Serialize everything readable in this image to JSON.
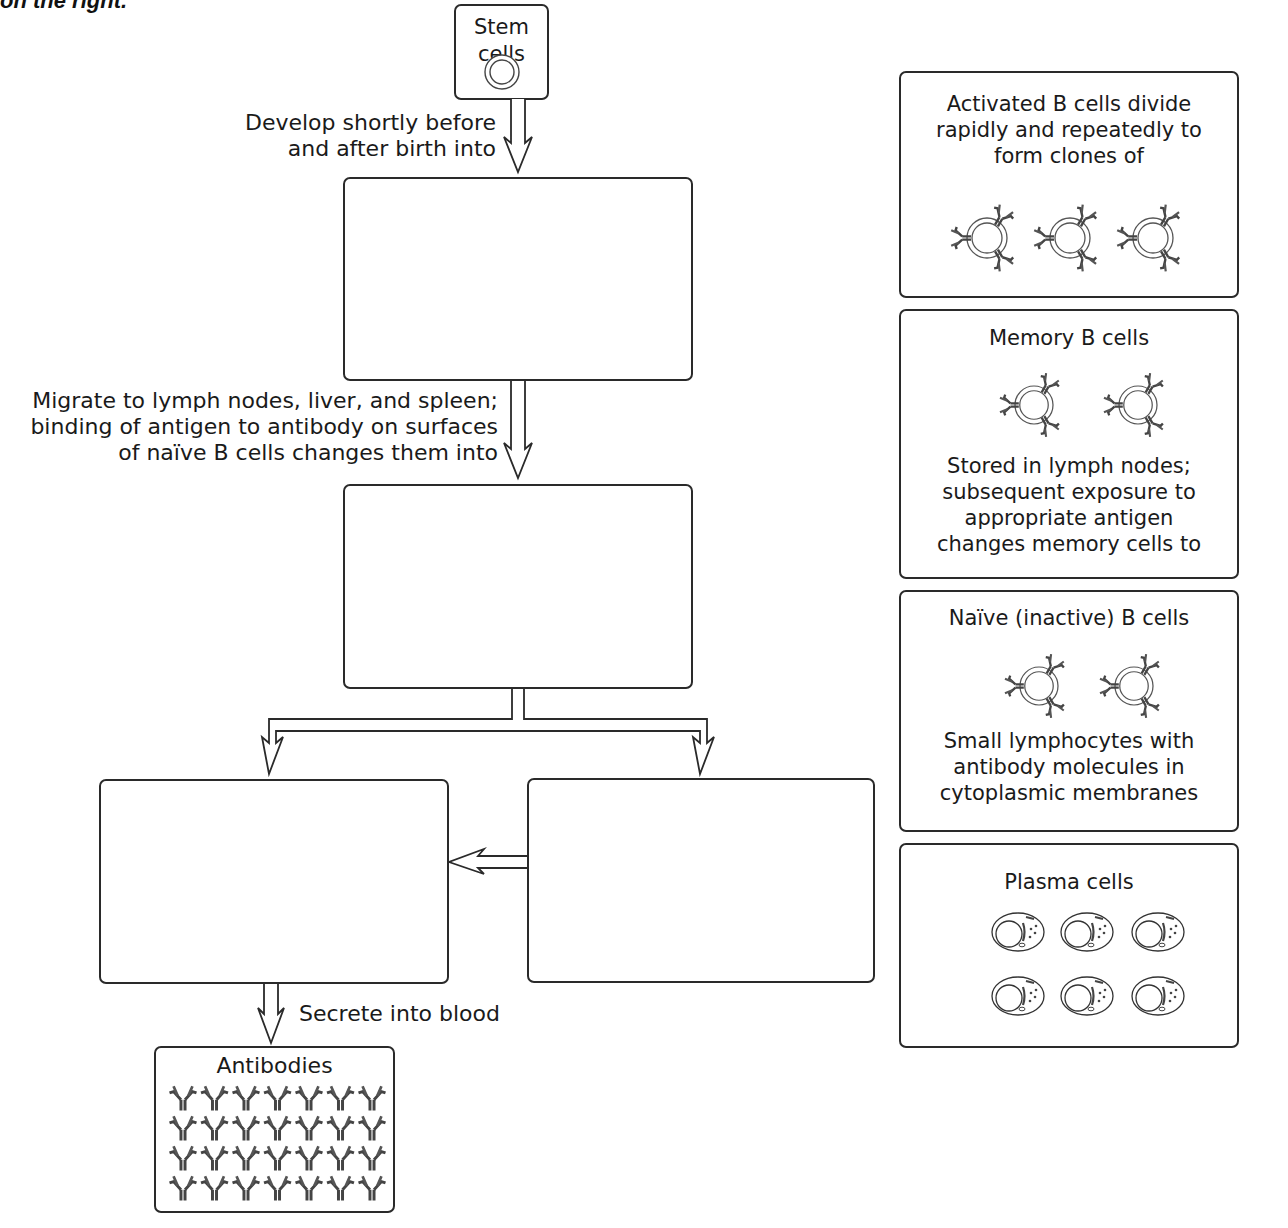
{
  "header": {
    "clipped_title": "on the right."
  },
  "flowchart": {
    "stem_cells": {
      "title": "Stem cells",
      "icon": "stem-cell-icon"
    },
    "arrow_labels": {
      "develop": [
        "Develop shortly before",
        "and after birth into"
      ],
      "migrate": [
        "Migrate to lymph nodes, liver, and spleen;",
        "binding of antigen to antibody on surfaces",
        "of naïve B cells changes them into"
      ],
      "secrete": "Secrete into blood"
    },
    "blank_boxes": [
      {
        "id": "blank-1",
        "value": ""
      },
      {
        "id": "blank-2",
        "value": ""
      },
      {
        "id": "blank-3-left",
        "value": ""
      },
      {
        "id": "blank-4-right",
        "value": ""
      }
    ],
    "antibodies": {
      "title": "Antibodies",
      "rows": 4,
      "columns": 7,
      "icon": "antibody-icon"
    }
  },
  "answer_cards": [
    {
      "title_lines": [
        "Activated B cells divide",
        "rapidly and repeatedly to",
        "form clones of"
      ],
      "cell_count": 3,
      "icon": "b-cell-with-antibodies-icon",
      "caption_lines": []
    },
    {
      "title_lines": [
        "Memory B cells"
      ],
      "cell_count": 2,
      "icon": "b-cell-with-antibodies-icon",
      "caption_lines": [
        "Stored in lymph nodes;",
        "subsequent exposure to",
        "appropriate antigen",
        "changes memory cells to"
      ]
    },
    {
      "title_lines": [
        "Naïve (inactive) B cells"
      ],
      "cell_count": 2,
      "icon": "b-cell-with-antibodies-icon",
      "caption_lines": [
        "Small lymphocytes with",
        "antibody molecules in",
        "cytoplasmic membranes"
      ]
    },
    {
      "title_lines": [
        "Plasma cells"
      ],
      "cell_count": 6,
      "icon": "plasma-cell-icon",
      "caption_lines": []
    }
  ],
  "colors": {
    "stroke": "#2a2a2a",
    "text": "#1a1a1a",
    "antibody": "#555555",
    "background": "#ffffff"
  }
}
